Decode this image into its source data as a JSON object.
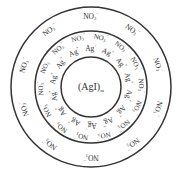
{
  "diagram": {
    "core_label": "(AgI)",
    "core_subscript": "m",
    "potential_ion": "Ag",
    "potential_ion_charge": "+",
    "counter_ion": "NO",
    "counter_ion_subscript": "3",
    "counter_ion_charge": "−",
    "circles": {
      "center_x": 91,
      "center_y": 87,
      "outer_radius": 80,
      "middle_radius": 56,
      "inner_radius": 30
    },
    "colors": {
      "line": "#333333",
      "text": "#333333",
      "background": "#ffffff"
    },
    "inner_ring": {
      "ag_count": 14,
      "ag_radius": 38
    },
    "middle_ring": {
      "no3_count": 14,
      "no3_radius": 50
    },
    "outer_ring": {
      "no3_count": 10,
      "no3_radius": 70
    }
  }
}
